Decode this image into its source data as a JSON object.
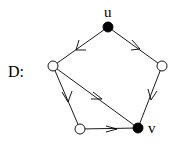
{
  "graph_label": "D:",
  "nodes": [
    {
      "id": "u",
      "label": "u",
      "x": 108,
      "y": 27,
      "filled": true
    },
    {
      "id": "a",
      "label": "",
      "x": 53,
      "y": 66,
      "filled": false
    },
    {
      "id": "b",
      "label": "",
      "x": 162,
      "y": 66,
      "filled": false
    },
    {
      "id": "c",
      "label": "",
      "x": 80,
      "y": 129,
      "filled": false
    },
    {
      "id": "v",
      "label": "v",
      "x": 138,
      "y": 128,
      "filled": true
    }
  ],
  "edges": [
    {
      "from": "u",
      "to": "a"
    },
    {
      "from": "u",
      "to": "b"
    },
    {
      "from": "a",
      "to": "c"
    },
    {
      "from": "a",
      "to": "v"
    },
    {
      "from": "b",
      "to": "v"
    },
    {
      "from": "c",
      "to": "v"
    }
  ],
  "colors": {
    "stroke": "#000000",
    "filled_node": "#000000",
    "open_node": "#ffffff"
  }
}
